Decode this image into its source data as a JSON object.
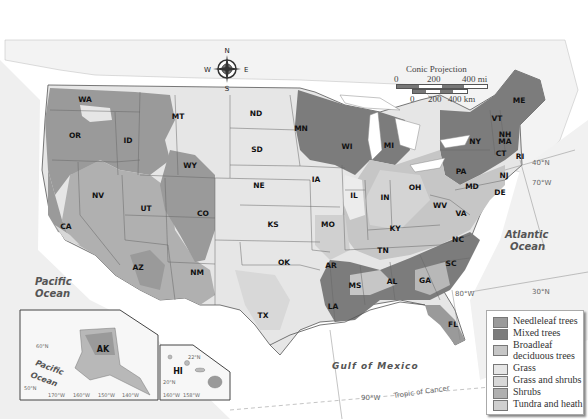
{
  "title": "United States: Natural Vegetation",
  "compass": {
    "n": "N",
    "s": "S",
    "e": "E",
    "w": "W"
  },
  "scale": {
    "projection": "Conic Projection",
    "mi_labels": [
      "0",
      "200",
      "400 mi"
    ],
    "km_labels": [
      "0",
      "200",
      "400 km"
    ]
  },
  "legend": {
    "items": [
      {
        "label": "Needleleaf trees",
        "color": "#9a9a9a"
      },
      {
        "label": "Mixed trees",
        "color": "#7c7c7c"
      },
      {
        "label": "Broadleaf deciduous trees",
        "color": "#c6c6c6"
      },
      {
        "label": "Grass",
        "color": "#e6e6e6"
      },
      {
        "label": "Grass and shrubs",
        "color": "#d8d8d8"
      },
      {
        "label": "Shrubs",
        "color": "#b0b0b0"
      },
      {
        "label": "Tundra and heath",
        "color": "#cfcfcf"
      }
    ]
  },
  "water_labels": {
    "pacific": [
      "Pacific",
      "Ocean"
    ],
    "atlantic": [
      "Atlantic",
      "Ocean"
    ],
    "gulf": "Gulf of Mexico",
    "inset_pacific": [
      "Pacific",
      "Ocean"
    ]
  },
  "lines": {
    "tropic": "Tropic of Cancer",
    "lon_90": "90°W",
    "lon_80": "80°W",
    "lon_70": "70°W",
    "lat_40": "40°N",
    "lat_30": "30°N"
  },
  "states": [
    {
      "abbr": "WA",
      "x": 85,
      "y": 102
    },
    {
      "abbr": "OR",
      "x": 75,
      "y": 138
    },
    {
      "abbr": "ID",
      "x": 128,
      "y": 143
    },
    {
      "abbr": "MT",
      "x": 178,
      "y": 119
    },
    {
      "abbr": "WY",
      "x": 190,
      "y": 168
    },
    {
      "abbr": "ND",
      "x": 256,
      "y": 116
    },
    {
      "abbr": "SD",
      "x": 257,
      "y": 152
    },
    {
      "abbr": "NE",
      "x": 259,
      "y": 188
    },
    {
      "abbr": "MN",
      "x": 301,
      "y": 131
    },
    {
      "abbr": "WI",
      "x": 347,
      "y": 149
    },
    {
      "abbr": "MI",
      "x": 389,
      "y": 148
    },
    {
      "abbr": "IA",
      "x": 316,
      "y": 182
    },
    {
      "abbr": "IL",
      "x": 354,
      "y": 198
    },
    {
      "abbr": "IN",
      "x": 385,
      "y": 200
    },
    {
      "abbr": "OH",
      "x": 415,
      "y": 190
    },
    {
      "abbr": "NV",
      "x": 98,
      "y": 198
    },
    {
      "abbr": "UT",
      "x": 146,
      "y": 211
    },
    {
      "abbr": "CO",
      "x": 203,
      "y": 216
    },
    {
      "abbr": "KS",
      "x": 273,
      "y": 227
    },
    {
      "abbr": "MO",
      "x": 328,
      "y": 227
    },
    {
      "abbr": "KY",
      "x": 395,
      "y": 231
    },
    {
      "abbr": "WV",
      "x": 440,
      "y": 208
    },
    {
      "abbr": "VA",
      "x": 461,
      "y": 216
    },
    {
      "abbr": "CA",
      "x": 66,
      "y": 229
    },
    {
      "abbr": "AZ",
      "x": 138,
      "y": 270
    },
    {
      "abbr": "NM",
      "x": 197,
      "y": 275
    },
    {
      "abbr": "OK",
      "x": 284,
      "y": 265
    },
    {
      "abbr": "AR",
      "x": 331,
      "y": 268
    },
    {
      "abbr": "TN",
      "x": 383,
      "y": 253
    },
    {
      "abbr": "NC",
      "x": 458,
      "y": 242
    },
    {
      "abbr": "SC",
      "x": 451,
      "y": 266
    },
    {
      "abbr": "MS",
      "x": 355,
      "y": 288
    },
    {
      "abbr": "AL",
      "x": 392,
      "y": 284
    },
    {
      "abbr": "GA",
      "x": 425,
      "y": 283
    },
    {
      "abbr": "LA",
      "x": 333,
      "y": 309
    },
    {
      "abbr": "TX",
      "x": 263,
      "y": 318
    },
    {
      "abbr": "FL",
      "x": 453,
      "y": 327
    },
    {
      "abbr": "NY",
      "x": 475,
      "y": 144
    },
    {
      "abbr": "PA",
      "x": 461,
      "y": 174
    },
    {
      "abbr": "VT",
      "x": 497,
      "y": 121
    },
    {
      "abbr": "NH",
      "x": 505,
      "y": 137
    },
    {
      "abbr": "MA",
      "x": 505,
      "y": 144
    },
    {
      "abbr": "ME",
      "x": 519,
      "y": 103
    },
    {
      "abbr": "CT",
      "x": 501,
      "y": 156
    },
    {
      "abbr": "RI",
      "x": 520,
      "y": 159
    },
    {
      "abbr": "NJ",
      "x": 504,
      "y": 178
    },
    {
      "abbr": "MD",
      "x": 472,
      "y": 189
    },
    {
      "abbr": "DE",
      "x": 500,
      "y": 195
    }
  ],
  "inset_alaska": {
    "label": "AK",
    "ticks": [
      "170°W",
      "160°W",
      "150°W",
      "140°W"
    ],
    "lat_ticks": [
      "60°N",
      "50°N"
    ]
  },
  "inset_hawaii": {
    "label": "HI",
    "ticks": [
      "160°W",
      "158°W"
    ],
    "lat_ticks": [
      "22°N",
      "20°N"
    ]
  }
}
